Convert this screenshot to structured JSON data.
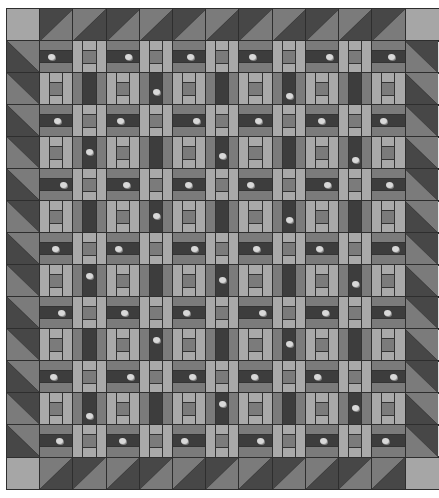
{
  "quilt": {
    "title": "Quilt layout preview",
    "interior": {
      "rows": 13,
      "cols": 11
    },
    "border_units": {
      "top": 11,
      "bottom": 11,
      "left": 13,
      "right": 13
    },
    "block_types": {
      "print_horizontal": "even row & even col: medium / dark print / medium horizontal strips",
      "print_vertical": "odd row & odd col: medium / dark print / medium vertical strips",
      "ladder": "mixed parity: light side bars with center column light / medium square / light"
    },
    "colors": {
      "background": "#ffffff",
      "seam": "#2e2e2e",
      "corner": "#a6a6a6",
      "light": "#a9a9a9",
      "medium": "#7b7b7b",
      "dark": "#474747",
      "print": "#3d3d3d",
      "motif": "#d8d8d8"
    }
  }
}
